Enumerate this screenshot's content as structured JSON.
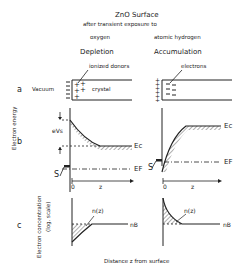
{
  "title": "ZnO Surface",
  "subtitle": "after transient exposure to",
  "conditions": {
    "left": "oxygen",
    "right": "atomic hydrogen"
  },
  "regimes": {
    "left": "Depletion",
    "right": "Accumulation"
  },
  "panel_labels": {
    "a": "a",
    "b": "b",
    "c": "c"
  },
  "panel_a": {
    "vacuum_label": "Vacuum",
    "crystal_label": "crystal",
    "donors_label": "ionized donors",
    "electrons_label": "electrons"
  },
  "panel_b": {
    "y_axis_label": "Electron energy",
    "surface_potential_label": "eVs",
    "conduction_band_label": "Ec",
    "fermi_level_label": "EF",
    "surface_state_label": "S",
    "origin_label": "0",
    "x_label": "z"
  },
  "panel_c": {
    "y_axis_label": "Electron concentration",
    "y_axis_sublabel": "(log. scale)",
    "curve_label": "n(z)",
    "bulk_label": "nB"
  },
  "x_caption": "Distance z from surface",
  "colors": {
    "ink": "#222222",
    "background": "#ffffff"
  }
}
